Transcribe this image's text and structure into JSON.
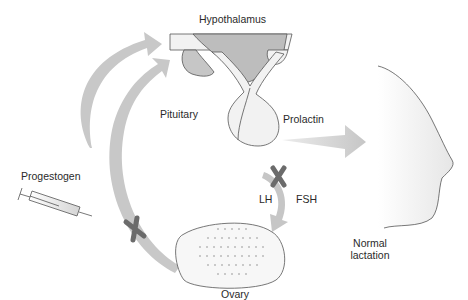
{
  "diagram": {
    "labels": {
      "hypothalamus": "Hypothalamus",
      "pituitary": "Pituitary",
      "prolactin": "Prolactin",
      "progestogen": "Progestogen",
      "lh": "LH",
      "fsh": "FSH",
      "ovary": "Ovary",
      "normal_lactation_line1": "Normal",
      "normal_lactation_line2": "lactation"
    },
    "icons": {
      "syringe": "syringe-icon",
      "block_marks": [
        "block-x-icon",
        "block-x-icon"
      ]
    },
    "colors": {
      "arrow_gray": "#c8c8c8",
      "gland_fill": "#f2f2f2",
      "shaded_fill": "#bdbdbd",
      "outline": "#555555",
      "block_x": "#6b6b6b",
      "text": "#2a2a2a"
    }
  }
}
